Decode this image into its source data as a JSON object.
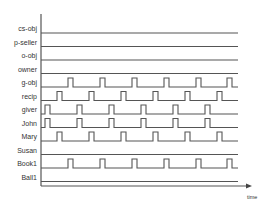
{
  "diagram": {
    "type": "timing-diagram",
    "x_axis_label": "time",
    "period_px": 32,
    "pulse_width_px": 5,
    "pulse_height_px": 9,
    "line_color": "#555555",
    "signals": [
      {
        "label": "cs-obj",
        "pulses": []
      },
      {
        "label": "p-seller",
        "pulses": []
      },
      {
        "label": "o-obj",
        "pulses": []
      },
      {
        "label": "owner",
        "pulses": []
      },
      {
        "label": "g-obj",
        "pulses": [
          68,
          100,
          132,
          164,
          196,
          227
        ]
      },
      {
        "label": "recip",
        "pulses": [
          57,
          89,
          121,
          153,
          185,
          217
        ]
      },
      {
        "label": "giver",
        "pulses": [
          45,
          77,
          109,
          141,
          173,
          205
        ]
      },
      {
        "label": "John",
        "pulses": [
          45,
          77,
          109,
          141,
          173,
          205
        ]
      },
      {
        "label": "Mary",
        "pulses": [
          57,
          89,
          121,
          153,
          185,
          217
        ]
      },
      {
        "label": "Susan",
        "pulses": []
      },
      {
        "label": "Book1",
        "pulses": [
          68,
          100,
          132,
          164,
          196,
          227
        ]
      },
      {
        "label": "Ball1",
        "pulses": []
      }
    ]
  }
}
